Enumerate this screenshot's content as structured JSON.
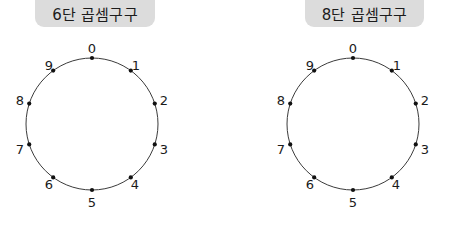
{
  "page": {
    "background_color": "#ffffff",
    "width": 460,
    "height": 229
  },
  "style": {
    "pill_background": "#dcdcdc",
    "circle_stroke": "#3b3b3b",
    "dot_color": "#111111",
    "text_color": "#1a1a1a"
  },
  "panels": [
    {
      "title": "6단 곱셈구구",
      "times_table": 6,
      "circle": {
        "center_x": 66,
        "center_y": 66,
        "radius": 66
      },
      "points": [
        {
          "label": "0",
          "angle_deg": 0,
          "lx": 66,
          "ly": -10
        },
        {
          "label": "1",
          "angle_deg": 36,
          "lx": 110,
          "ly": 7
        },
        {
          "label": "2",
          "angle_deg": 72,
          "lx": 138,
          "ly": 42
        },
        {
          "label": "3",
          "angle_deg": 108,
          "lx": 138,
          "ly": 91
        },
        {
          "label": "4",
          "angle_deg": 144,
          "lx": 109,
          "ly": 126
        },
        {
          "label": "5",
          "angle_deg": 180,
          "lx": 66,
          "ly": 144
        },
        {
          "label": "6",
          "angle_deg": 216,
          "lx": 23,
          "ly": 126
        },
        {
          "label": "7",
          "angle_deg": 252,
          "lx": -6,
          "ly": 91
        },
        {
          "label": "8",
          "angle_deg": 288,
          "lx": -6,
          "ly": 42
        },
        {
          "label": "9",
          "angle_deg": 324,
          "lx": 23,
          "ly": 7
        }
      ]
    },
    {
      "title": "8단 곱셈구구",
      "times_table": 8,
      "circle": {
        "center_x": 66,
        "center_y": 66,
        "radius": 66
      },
      "points": [
        {
          "label": "0",
          "angle_deg": 0,
          "lx": 66,
          "ly": -10
        },
        {
          "label": "1",
          "angle_deg": 36,
          "lx": 110,
          "ly": 7
        },
        {
          "label": "2",
          "angle_deg": 72,
          "lx": 138,
          "ly": 42
        },
        {
          "label": "3",
          "angle_deg": 108,
          "lx": 138,
          "ly": 91
        },
        {
          "label": "4",
          "angle_deg": 144,
          "lx": 109,
          "ly": 126
        },
        {
          "label": "5",
          "angle_deg": 180,
          "lx": 66,
          "ly": 144
        },
        {
          "label": "6",
          "angle_deg": 216,
          "lx": 23,
          "ly": 126
        },
        {
          "label": "7",
          "angle_deg": 252,
          "lx": -6,
          "ly": 91
        },
        {
          "label": "8",
          "angle_deg": 288,
          "lx": -6,
          "ly": 42
        },
        {
          "label": "9",
          "angle_deg": 324,
          "lx": 23,
          "ly": 7
        }
      ]
    }
  ]
}
